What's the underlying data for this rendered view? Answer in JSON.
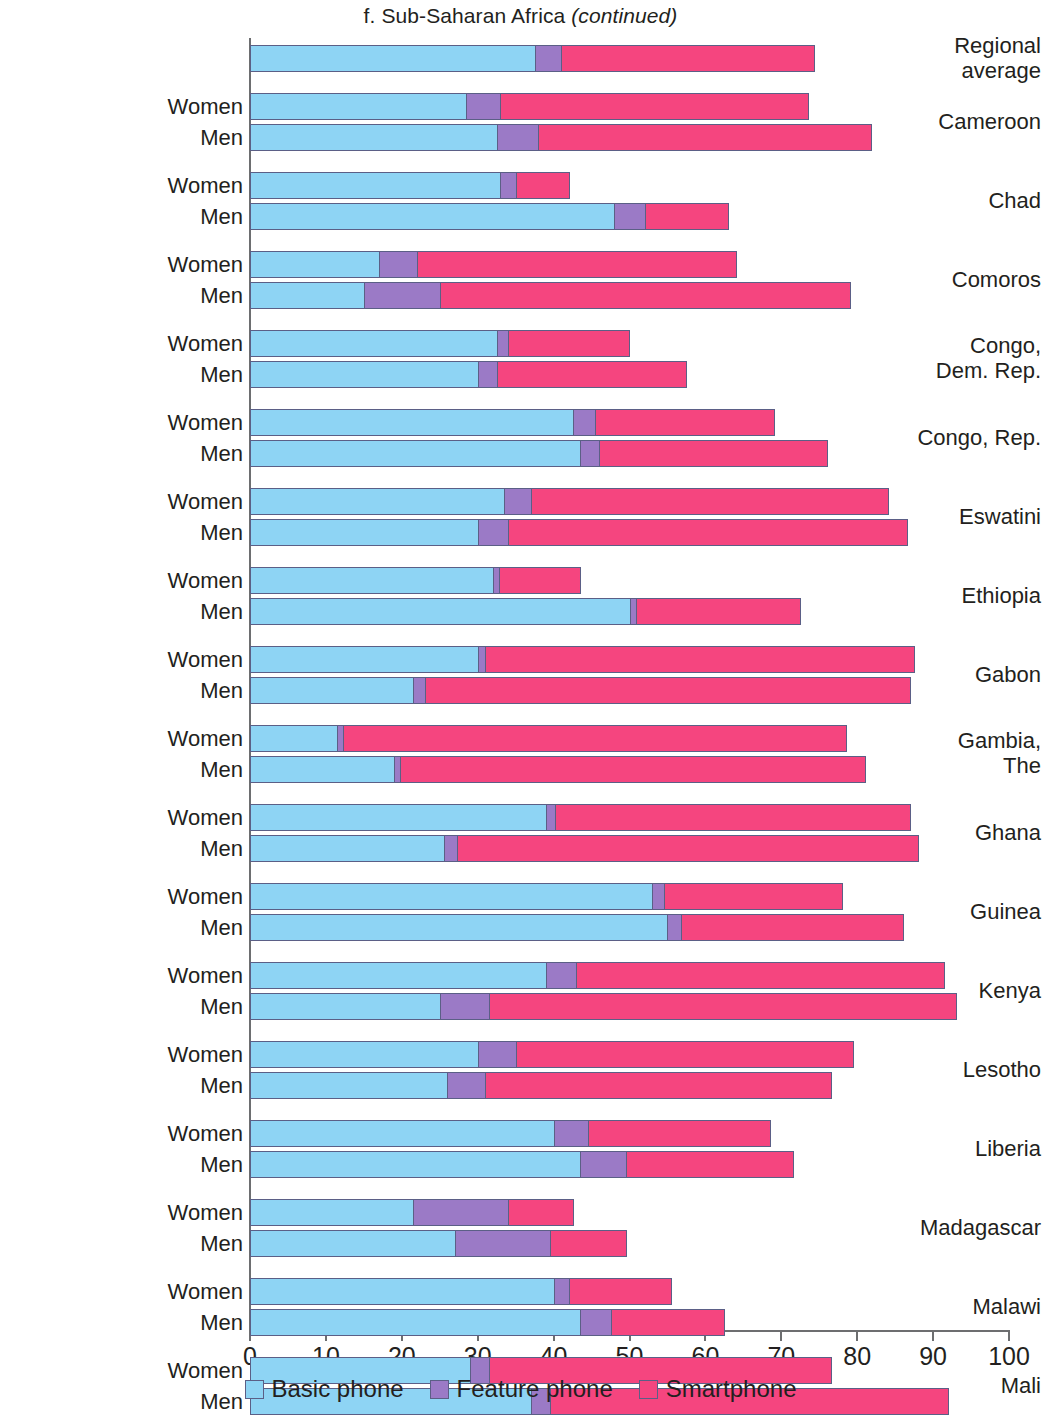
{
  "title": {
    "prefix": "f. Sub-Saharan Africa ",
    "continued": "(continued)",
    "full": "f. Sub-Saharan Africa (continued)"
  },
  "legend": {
    "items": [
      {
        "label": "Basic phone",
        "color": "#8ed4f4",
        "key": "basic"
      },
      {
        "label": "Feature phone",
        "color": "#9b7ac6",
        "key": "feature"
      },
      {
        "label": "Smartphone",
        "color": "#f5457f",
        "key": "smart"
      }
    ]
  },
  "axis": {
    "tick_labels": [
      "0",
      "10",
      "20",
      "30",
      "40",
      "50",
      "60",
      "70",
      "80",
      "90",
      "100"
    ],
    "min": 0,
    "max": 100,
    "step": 10
  },
  "sex_labels": {
    "women": "Women",
    "men": "Men"
  },
  "chart_data": {
    "type": "bar",
    "orientation": "horizontal",
    "stacked": true,
    "title": "f. Sub-Saharan Africa (continued)",
    "xlabel": "",
    "ylabel": "",
    "xlim": [
      0,
      100
    ],
    "xticks": [
      0,
      10,
      20,
      30,
      40,
      50,
      60,
      70,
      80,
      90,
      100
    ],
    "grid": false,
    "legend_position": "bottom",
    "series_names": [
      "Basic phone",
      "Feature phone",
      "Smartphone"
    ],
    "series_colors": [
      "#8ed4f4",
      "#9b7ac6",
      "#f5457f"
    ],
    "groups": [
      {
        "category": "Regional average",
        "category_lines": [
          "Regional",
          "average"
        ],
        "single_bar": true,
        "rows": [
          {
            "sex": "",
            "basic": 37.5,
            "feature": 3.5,
            "smart": 33.3,
            "total": 74.3
          }
        ]
      },
      {
        "category": "Cameroon",
        "category_lines": [
          "Cameroon"
        ],
        "rows": [
          {
            "sex": "Women",
            "basic": 28.5,
            "feature": 4.5,
            "smart": 40.5,
            "total": 73.5
          },
          {
            "sex": "Men",
            "basic": 32.5,
            "feature": 5.5,
            "smart": 43.8,
            "total": 81.8
          }
        ]
      },
      {
        "category": "Chad",
        "category_lines": [
          "Chad"
        ],
        "rows": [
          {
            "sex": "Women",
            "basic": 33.0,
            "feature": 2.0,
            "smart": 7.0,
            "total": 42.0
          },
          {
            "sex": "Men",
            "basic": 48.0,
            "feature": 4.0,
            "smart": 11.0,
            "total": 63.0
          }
        ]
      },
      {
        "category": "Comoros",
        "category_lines": [
          "Comoros"
        ],
        "rows": [
          {
            "sex": "Women",
            "basic": 17.0,
            "feature": 5.0,
            "smart": 42.0,
            "total": 64.0
          },
          {
            "sex": "Men",
            "basic": 15.0,
            "feature": 10.0,
            "smart": 54.0,
            "total": 79.0
          }
        ]
      },
      {
        "category": "Congo, Dem. Rep.",
        "category_lines": [
          "Congo,",
          "Dem. Rep."
        ],
        "rows": [
          {
            "sex": "Women",
            "basic": 32.5,
            "feature": 1.5,
            "smart": 16.0,
            "total": 50.0
          },
          {
            "sex": "Men",
            "basic": 30.0,
            "feature": 2.5,
            "smart": 25.0,
            "total": 57.5
          }
        ]
      },
      {
        "category": "Congo, Rep.",
        "category_lines": [
          "Congo, Rep."
        ],
        "rows": [
          {
            "sex": "Women",
            "basic": 42.5,
            "feature": 3.0,
            "smart": 23.5,
            "total": 69.0
          },
          {
            "sex": "Men",
            "basic": 43.5,
            "feature": 2.5,
            "smart": 30.0,
            "total": 76.0
          }
        ]
      },
      {
        "category": "Eswatini",
        "category_lines": [
          "Eswatini"
        ],
        "rows": [
          {
            "sex": "Women",
            "basic": 33.5,
            "feature": 3.5,
            "smart": 47.0,
            "total": 84.0
          },
          {
            "sex": "Men",
            "basic": 30.0,
            "feature": 4.0,
            "smart": 52.5,
            "total": 86.5
          }
        ]
      },
      {
        "category": "Ethiopia",
        "category_lines": [
          "Ethiopia"
        ],
        "rows": [
          {
            "sex": "Women",
            "basic": 32.0,
            "feature": 0.8,
            "smart": 10.7,
            "total": 43.5
          },
          {
            "sex": "Men",
            "basic": 50.0,
            "feature": 0.8,
            "smart": 21.7,
            "total": 72.5
          }
        ]
      },
      {
        "category": "Gabon",
        "category_lines": [
          "Gabon"
        ],
        "rows": [
          {
            "sex": "Women",
            "basic": 30.0,
            "feature": 1.0,
            "smart": 56.5,
            "total": 87.5
          },
          {
            "sex": "Men",
            "basic": 21.5,
            "feature": 1.5,
            "smart": 64.0,
            "total": 87.0
          }
        ]
      },
      {
        "category": "Gambia, The",
        "category_lines": [
          "Gambia,",
          "The"
        ],
        "rows": [
          {
            "sex": "Women",
            "basic": 11.5,
            "feature": 0.8,
            "smart": 66.2,
            "total": 78.5
          },
          {
            "sex": "Men",
            "basic": 19.0,
            "feature": 0.8,
            "smart": 61.2,
            "total": 81.0
          }
        ]
      },
      {
        "category": "Ghana",
        "category_lines": [
          "Ghana"
        ],
        "rows": [
          {
            "sex": "Women",
            "basic": 39.0,
            "feature": 1.2,
            "smart": 46.8,
            "total": 87.0
          },
          {
            "sex": "Men",
            "basic": 25.5,
            "feature": 1.8,
            "smart": 60.7,
            "total": 88.0
          }
        ]
      },
      {
        "category": "Guinea",
        "category_lines": [
          "Guinea"
        ],
        "rows": [
          {
            "sex": "Women",
            "basic": 53.0,
            "feature": 1.5,
            "smart": 23.5,
            "total": 78.0
          },
          {
            "sex": "Men",
            "basic": 55.0,
            "feature": 1.8,
            "smart": 29.2,
            "total": 86.0
          }
        ]
      },
      {
        "category": "Kenya",
        "category_lines": [
          "Kenya"
        ],
        "rows": [
          {
            "sex": "Women",
            "basic": 39.0,
            "feature": 4.0,
            "smart": 48.5,
            "total": 91.5
          },
          {
            "sex": "Men",
            "basic": 25.0,
            "feature": 6.5,
            "smart": 61.5,
            "total": 93.0
          }
        ]
      },
      {
        "category": "Lesotho",
        "category_lines": [
          "Lesotho"
        ],
        "rows": [
          {
            "sex": "Women",
            "basic": 30.0,
            "feature": 5.0,
            "smart": 44.5,
            "total": 79.5
          },
          {
            "sex": "Men",
            "basic": 26.0,
            "feature": 5.0,
            "smart": 45.5,
            "total": 76.5
          }
        ]
      },
      {
        "category": "Liberia",
        "category_lines": [
          "Liberia"
        ],
        "rows": [
          {
            "sex": "Women",
            "basic": 40.0,
            "feature": 4.5,
            "smart": 24.0,
            "total": 68.5
          },
          {
            "sex": "Men",
            "basic": 43.5,
            "feature": 6.0,
            "smart": 22.0,
            "total": 71.5
          }
        ]
      },
      {
        "category": "Madagascar",
        "category_lines": [
          "Madagascar"
        ],
        "rows": [
          {
            "sex": "Women",
            "basic": 21.5,
            "feature": 12.5,
            "smart": 8.5,
            "total": 42.5
          },
          {
            "sex": "Men",
            "basic": 27.0,
            "feature": 12.5,
            "smart": 10.0,
            "total": 49.5
          }
        ]
      },
      {
        "category": "Malawi",
        "category_lines": [
          "Malawi"
        ],
        "rows": [
          {
            "sex": "Women",
            "basic": 40.0,
            "feature": 2.0,
            "smart": 13.5,
            "total": 55.5
          },
          {
            "sex": "Men",
            "basic": 43.5,
            "feature": 4.0,
            "smart": 15.0,
            "total": 62.5
          }
        ]
      },
      {
        "category": "Mali",
        "category_lines": [
          "Mali"
        ],
        "rows": [
          {
            "sex": "Women",
            "basic": 29.0,
            "feature": 2.5,
            "smart": 45.0,
            "total": 76.5
          },
          {
            "sex": "Men",
            "basic": 37.0,
            "feature": 2.5,
            "smart": 52.5,
            "total": 92.0
          }
        ]
      }
    ]
  }
}
